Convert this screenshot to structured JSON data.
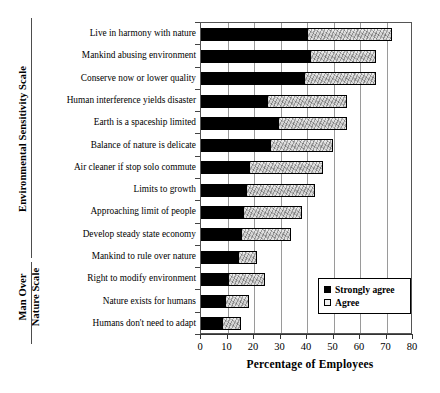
{
  "chart_data": {
    "type": "bar",
    "orientation": "horizontal",
    "stacked": true,
    "title": "",
    "xlabel": "Percentage of Employees",
    "ylabel": "",
    "xlim": [
      0,
      80
    ],
    "xticks": [
      0,
      10,
      20,
      30,
      40,
      50,
      60,
      70,
      80
    ],
    "grid": true,
    "grid_axis": "x",
    "legend_position": "lower right",
    "categories": [
      "Live in harmony with nature",
      "Mankind abusing environment",
      "Conserve now or lower quality",
      "Human interference yields disaster",
      "Earth is a spaceship limited",
      "Balance of nature is delicate",
      "Air cleaner if stop solo commute",
      "Limits to growth",
      "Approaching limit of people",
      "Develop steady state economy",
      "Mankind to rule over nature",
      "Right to modify environment",
      "Nature exists for humans",
      "Humans don't need to adapt"
    ],
    "series": [
      {
        "name": "Strongly agree",
        "values": [
          40,
          41,
          39,
          25,
          29,
          26,
          18,
          17,
          16,
          15,
          14,
          10,
          9,
          8
        ]
      },
      {
        "name": "Agree",
        "values": [
          32,
          25,
          27,
          30,
          26,
          24,
          28,
          26,
          22,
          19,
          7,
          14,
          9,
          7
        ]
      }
    ],
    "totals": [
      72,
      66,
      66,
      55,
      55,
      50,
      46,
      43,
      38,
      34,
      21,
      24,
      18,
      15
    ],
    "group_labels": [
      {
        "label": "Environmental Sensitivity Scale",
        "categories": [
          "Live in harmony with nature",
          "Mankind abusing environment",
          "Conserve now or lower quality",
          "Human interference yields disaster",
          "Earth is a spaceship limited",
          "Balance of nature is delicate",
          "Air cleaner if stop solo commute",
          "Limits to growth",
          "Approaching limit of people",
          "Develop steady state economy"
        ]
      },
      {
        "label_line1": "Man Over",
        "label_line2": "Nature Scale",
        "label": "Man Over Nature Scale",
        "categories": [
          "Mankind to rule over nature",
          "Right to modify environment",
          "Nature exists for humans",
          "Humans don't need to adapt"
        ]
      }
    ],
    "colors": {
      "strongly_agree": "#000000",
      "agree": "#d8d8d8",
      "axis": "#333333",
      "grid": "#9a9a9a"
    }
  },
  "legend": {
    "items": [
      {
        "label": "Strongly agree"
      },
      {
        "label": "Agree"
      }
    ]
  },
  "axis": {
    "x_title": "Percentage of Employees",
    "tick_labels": [
      "0",
      "10",
      "20",
      "30",
      "40",
      "50",
      "60",
      "70",
      "80"
    ]
  }
}
